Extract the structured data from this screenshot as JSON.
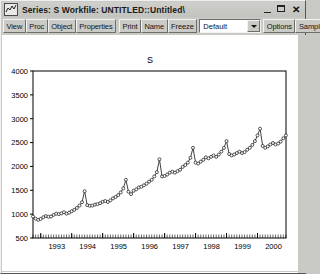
{
  "window": {
    "title": "Series: S   Workfile: UNTITLED::Untitled\\",
    "icon": "series-chart-icon",
    "minimize_label": "",
    "maximize_label": "",
    "close_label": "✕"
  },
  "toolbar": {
    "buttons": [
      {
        "label": "View",
        "name": "view-button"
      },
      {
        "label": "Proc",
        "name": "proc-button"
      },
      {
        "label": "Object",
        "name": "object-button"
      },
      {
        "label": "Properties",
        "name": "properties-button"
      }
    ],
    "buttons2": [
      {
        "label": "Print",
        "name": "print-button"
      },
      {
        "label": "Name",
        "name": "name-button"
      },
      {
        "label": "Freeze",
        "name": "freeze-button"
      }
    ],
    "combo": {
      "value": "Default",
      "name": "view-style-combo"
    },
    "buttons3": [
      {
        "label": "Options",
        "name": "options-button"
      },
      {
        "label": "Sample",
        "name": "sample-button"
      },
      {
        "label": "G",
        "name": "genr-button"
      }
    ]
  },
  "chart_data": {
    "type": "line",
    "title": "S",
    "xlabel": "",
    "ylabel": "",
    "ylim": [
      500,
      4000
    ],
    "yticks": [
      500,
      1000,
      1500,
      2000,
      2500,
      3000,
      3500,
      4000
    ],
    "xticks": [
      1993,
      1994,
      1995,
      1996,
      1997,
      1998,
      1999,
      2000
    ],
    "xtick_labels": [
      "1993",
      "1994",
      "1995",
      "1996",
      "1997",
      "1998",
      "1999",
      "2000"
    ],
    "grid": false,
    "legend": false,
    "markers": "open-circle",
    "x_start": 1992.75,
    "x_end": 2000.92,
    "x_step": 0.08333,
    "series": [
      {
        "name": "S",
        "values": [
          950,
          905,
          880,
          900,
          935,
          960,
          945,
          950,
          985,
          1010,
          1000,
          1015,
          1040,
          1010,
          1030,
          1060,
          1090,
          1130,
          1180,
          1250,
          1480,
          1190,
          1175,
          1180,
          1200,
          1210,
          1230,
          1260,
          1275,
          1255,
          1290,
          1330,
          1360,
          1400,
          1455,
          1540,
          1720,
          1470,
          1420,
          1490,
          1520,
          1560,
          1575,
          1605,
          1640,
          1680,
          1720,
          1790,
          1880,
          2150,
          1790,
          1800,
          1830,
          1870,
          1890,
          1870,
          1900,
          1930,
          1990,
          2030,
          2080,
          2180,
          2390,
          2080,
          2060,
          2100,
          2140,
          2190,
          2170,
          2200,
          2230,
          2200,
          2250,
          2310,
          2390,
          2530,
          2260,
          2230,
          2250,
          2280,
          2310,
          2280,
          2300,
          2350,
          2390,
          2450,
          2530,
          2650,
          2790,
          2430,
          2390,
          2420,
          2460,
          2490,
          2460,
          2480,
          2520,
          2590,
          2650,
          2720,
          2860,
          3140,
          2650,
          2620,
          2650,
          2670,
          2700,
          2680,
          2700,
          2760,
          2830,
          2900,
          3010,
          3180,
          3520
        ]
      }
    ]
  }
}
